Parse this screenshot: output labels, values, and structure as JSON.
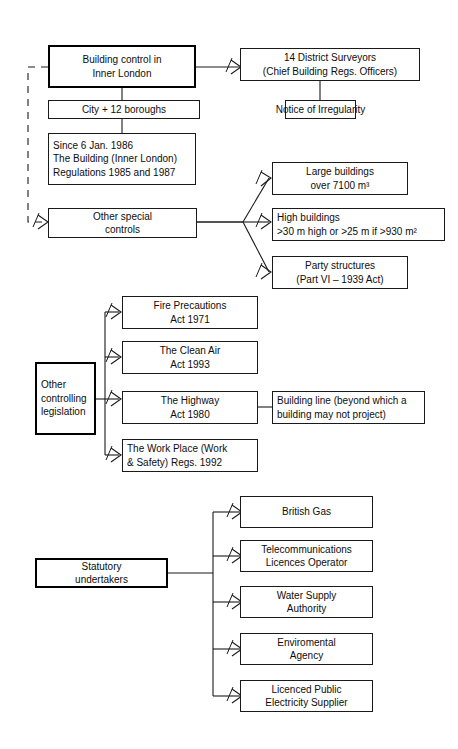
{
  "diagram": {
    "accent_color": "#000000",
    "box_fill": "#ffffff",
    "line_color": "#1a1a1a"
  },
  "groups": {
    "inner_london": {
      "root": {
        "lines": [
          "Building control in",
          "Inner London"
        ]
      },
      "surveyors": {
        "lines": [
          "14 District Surveyors",
          "(Chief Building Regs. Officers)"
        ]
      },
      "notice": {
        "lines": [
          "Notice of Irregularity"
        ]
      },
      "boroughs": {
        "lines": [
          "City + 12 boroughs"
        ]
      },
      "regulations": {
        "lines": [
          "Since 6 Jan. 1986",
          "The Building (Inner London)",
          "Regulations  1985 and 1987"
        ]
      },
      "special_controls": {
        "lines": [
          "Other special",
          "controls"
        ]
      },
      "special_items": [
        {
          "lines": [
            "Large buildings",
            "over 7100 m³"
          ],
          "align": "center"
        },
        {
          "lines": [
            "High buildings",
            ">30 m high  or >25 m  if >930 m²"
          ],
          "align": "left"
        },
        {
          "lines": [
            "Party structures",
            "(Part VI – 1939 Act)"
          ],
          "align": "center"
        }
      ]
    },
    "legislation": {
      "root": {
        "lines": [
          "Other",
          "controlling",
          "legislation"
        ]
      },
      "items": [
        {
          "lines": [
            "Fire Precautions",
            "Act 1971"
          ],
          "align": "center"
        },
        {
          "lines": [
            "The Clean Air",
            "Act 1993"
          ],
          "align": "center"
        },
        {
          "lines": [
            "The Highway",
            "Act 1980"
          ],
          "align": "center"
        },
        {
          "lines": [
            "The Work Place (Work",
            "& Safety) Regs. 1992"
          ],
          "align": "left"
        }
      ],
      "highway_note": {
        "lines": [
          "Building line (beyond which a",
          "building may not project)"
        ]
      }
    },
    "statutory": {
      "root": {
        "lines": [
          "Statutory",
          "undertakers"
        ]
      },
      "items": [
        {
          "lines": [
            "British Gas"
          ]
        },
        {
          "lines": [
            "Telecommunications",
            "Licences Operator"
          ]
        },
        {
          "lines": [
            "Water Supply",
            "Authority"
          ]
        },
        {
          "lines": [
            "Enviromental",
            "Agency"
          ]
        },
        {
          "lines": [
            "Licenced Public",
            "Electricity Supplier"
          ]
        }
      ]
    }
  }
}
